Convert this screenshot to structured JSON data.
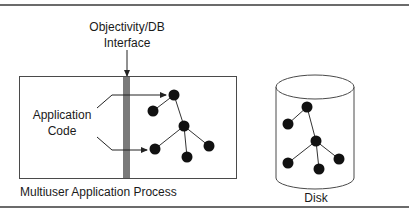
{
  "diagram": {
    "interface_label_line1": "Objectivity/DB",
    "interface_label_line2": "Interface",
    "app_code_label_line1": "Application",
    "app_code_label_line2": "Code",
    "process_label": "Multiuser Application Process",
    "disk_label": "Disk",
    "colors": {
      "rule": "#3a3a3a",
      "outline": "#4a4a4a",
      "interface_bar": "#7a7a7a",
      "node": "#111111",
      "text": "#1a1a1a"
    },
    "app_tree": {
      "nodes": [
        {
          "id": "a1",
          "x": 174,
          "y": 95
        },
        {
          "id": "a2",
          "x": 153,
          "y": 111
        },
        {
          "id": "a3",
          "x": 184,
          "y": 126
        },
        {
          "id": "a4",
          "x": 155,
          "y": 149
        },
        {
          "id": "a5",
          "x": 187,
          "y": 157
        },
        {
          "id": "a6",
          "x": 209,
          "y": 146
        }
      ],
      "edges": [
        [
          "a1",
          "a2"
        ],
        [
          "a1",
          "a3"
        ],
        [
          "a3",
          "a4"
        ],
        [
          "a3",
          "a5"
        ],
        [
          "a3",
          "a6"
        ]
      ]
    },
    "disk_tree": {
      "nodes": [
        {
          "id": "d1",
          "x": 307,
          "y": 107
        },
        {
          "id": "d2",
          "x": 288,
          "y": 124
        },
        {
          "id": "d3",
          "x": 316,
          "y": 141
        },
        {
          "id": "d4",
          "x": 288,
          "y": 163
        },
        {
          "id": "d5",
          "x": 319,
          "y": 169
        },
        {
          "id": "d6",
          "x": 339,
          "y": 159
        }
      ],
      "edges": [
        [
          "d1",
          "d2"
        ],
        [
          "d1",
          "d3"
        ],
        [
          "d3",
          "d4"
        ],
        [
          "d3",
          "d5"
        ],
        [
          "d3",
          "d6"
        ]
      ]
    }
  }
}
